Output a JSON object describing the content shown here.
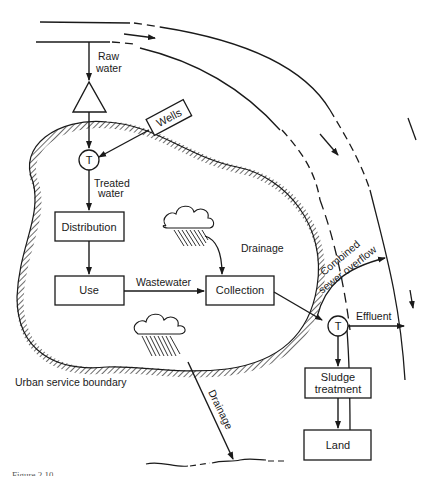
{
  "diagram": {
    "colors": {
      "ink": "#1a1a1a",
      "background": "#ffffff"
    },
    "nodes": {
      "raw_water_label": "Raw\nwater",
      "raw_water_label_line1": "Raw",
      "raw_water_label_line2": "water",
      "wells": "Wells",
      "treatment_symbol": "T",
      "treated_water_line1": "Treated",
      "treated_water_line2": "water",
      "distribution": "Distribution",
      "use": "Use",
      "wastewater": "Wastewater",
      "collection": "Collection",
      "drainage_inner": "Drainage",
      "combined_line1": "Combined",
      "combined_line2": "sewer overflow",
      "wastewater_treatment_symbol": "T",
      "effluent": "Effluent",
      "sludge_line1": "Sludge",
      "sludge_line2": "treatment",
      "land": "Land",
      "drainage_outer": "Drainage",
      "boundary_label": "Urban service boundary"
    },
    "caption": "Figure 2.10"
  }
}
